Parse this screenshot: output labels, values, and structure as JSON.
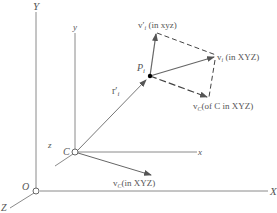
{
  "colors": {
    "axis": "#8a8a8a",
    "vector": "#666666",
    "dash": "#444444",
    "text": "#555555"
  },
  "labels": {
    "Y_axis": "Y",
    "X_axis": "X",
    "Z_axis": "Z",
    "origin": "O",
    "y_axis": "y",
    "x_axis": "x",
    "z_axis": "z",
    "moving_origin": "C",
    "point": "P",
    "point_sub": "i",
    "r_vec": "r′",
    "r_sub": "i",
    "vprime_prefix": "v′",
    "vprime_sub": "i",
    "vprime_suffix": " (in xyz)",
    "vi_prefix": "v",
    "vi_sub": "i",
    "vi_suffix": " (in XYZ)",
    "vc_top_prefix": "v",
    "vc_top_sub": "C",
    "vc_top_suffix": "(of C in XYZ)",
    "vc_bottom_prefix": "v",
    "vc_bottom_sub": "C",
    "vc_bottom_suffix": "(in XYZ)"
  }
}
